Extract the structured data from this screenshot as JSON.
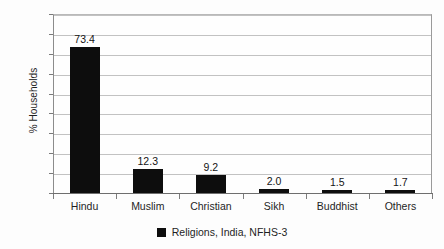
{
  "chart_data": {
    "type": "bar",
    "title": "",
    "subtitle": "",
    "xlabel": "",
    "ylabel": "% Households",
    "categories": [
      "Hindu",
      "Muslim",
      "Christian",
      "Sikh",
      "Buddhist",
      "Others"
    ],
    "values": [
      73.4,
      12.3,
      9.2,
      2.0,
      1.5,
      1.7
    ],
    "value_labels": [
      "73.4",
      "12.3",
      "9.2",
      "2.0",
      "1.5",
      "1.7"
    ],
    "ylim": [
      0,
      90
    ],
    "ytick_labels": [
      "90",
      "80",
      "70",
      "60",
      "50",
      "40",
      "30",
      "20",
      "10",
      "0"
    ],
    "ytick_values": [
      90,
      80,
      70,
      60,
      50,
      40,
      30,
      20,
      10,
      0
    ],
    "grid": "horizontal",
    "legend_position": "bottom-center",
    "legend": [
      {
        "label": "Religions, India, NFHS-3",
        "color": "#0d0d0d"
      }
    ],
    "series": [
      {
        "name": "Religions, India, NFHS-3",
        "color": "#0d0d0d",
        "values": [
          73.4,
          12.3,
          9.2,
          2.0,
          1.5,
          1.7
        ]
      }
    ]
  }
}
